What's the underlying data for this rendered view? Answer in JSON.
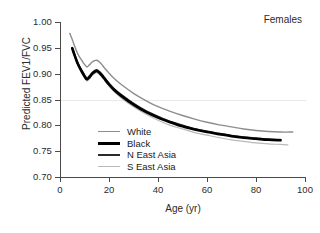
{
  "panel": {
    "title": "Females"
  },
  "axes": {
    "y": {
      "label": "Predicted FEV1/FVC",
      "ticks": [
        "1.00",
        "0.95",
        "0.90",
        "0.85",
        "0.80",
        "0.75",
        "0.70"
      ],
      "min": 0.7,
      "max": 1.0,
      "gridlines": [
        0.85
      ]
    },
    "x": {
      "label": "Age (yr)",
      "ticks": [
        "0",
        "20",
        "40",
        "60",
        "80",
        "100"
      ],
      "min": 0,
      "max": 100
    }
  },
  "legend": {
    "position": "inside-lower-left",
    "items": [
      {
        "label": "White",
        "color": "#8d8d8d",
        "width": 1.4
      },
      {
        "label": "Black",
        "color": "#000000",
        "width": 2.6
      },
      {
        "label": "N East Asia",
        "color": "#2a2a2a",
        "width": 1.9
      },
      {
        "label": "S East Asia",
        "color": "#b9b9b9",
        "width": 1.2
      }
    ]
  },
  "chart_data": {
    "type": "line",
    "title": "Females",
    "xlabel": "Age (yr)",
    "ylabel": "Predicted FEV1/FVC",
    "xlim": [
      0,
      100
    ],
    "ylim": [
      0.7,
      1.0
    ],
    "grid": "horizontal-at-0.85",
    "legend_position": "inside-lower-left",
    "series": [
      {
        "name": "White",
        "color": "#8d8d8d",
        "linewidth": 1.4,
        "x": [
          4,
          5,
          6,
          7,
          8,
          9,
          10,
          11,
          12,
          13,
          14,
          15,
          16,
          17,
          18,
          20,
          22,
          25,
          30,
          35,
          40,
          45,
          50,
          55,
          60,
          65,
          70,
          75,
          80,
          85,
          90,
          95
        ],
        "y": [
          0.978,
          0.966,
          0.953,
          0.941,
          0.932,
          0.925,
          0.918,
          0.913,
          0.917,
          0.922,
          0.925,
          0.926,
          0.923,
          0.918,
          0.912,
          0.901,
          0.891,
          0.879,
          0.862,
          0.848,
          0.836,
          0.827,
          0.819,
          0.812,
          0.806,
          0.801,
          0.797,
          0.793,
          0.79,
          0.788,
          0.787,
          0.787
        ]
      },
      {
        "name": "Black",
        "color": "#000000",
        "linewidth": 2.6,
        "x": [
          5,
          6,
          7,
          8,
          9,
          10,
          11,
          12,
          13,
          14,
          15,
          16,
          17,
          18,
          20,
          22,
          25,
          30,
          35,
          40,
          45,
          50,
          55,
          60,
          65,
          70,
          75,
          80,
          85,
          90
        ],
        "y": [
          0.949,
          0.935,
          0.922,
          0.912,
          0.903,
          0.895,
          0.889,
          0.893,
          0.899,
          0.903,
          0.905,
          0.902,
          0.897,
          0.891,
          0.879,
          0.869,
          0.857,
          0.84,
          0.826,
          0.815,
          0.806,
          0.798,
          0.792,
          0.787,
          0.783,
          0.779,
          0.776,
          0.774,
          0.772,
          0.771
        ]
      },
      {
        "name": "N East Asia",
        "color": "#2a2a2a",
        "linewidth": 1.9,
        "x": [
          5,
          6,
          7,
          8,
          9,
          10,
          11,
          12,
          13,
          14,
          15,
          16,
          17,
          18,
          20,
          22,
          25,
          30,
          35,
          40,
          45,
          50,
          55,
          60,
          65,
          70,
          75,
          80,
          85,
          90
        ],
        "y": [
          0.95,
          0.936,
          0.923,
          0.913,
          0.905,
          0.897,
          0.891,
          0.895,
          0.901,
          0.905,
          0.907,
          0.904,
          0.899,
          0.893,
          0.881,
          0.871,
          0.859,
          0.842,
          0.828,
          0.817,
          0.807,
          0.8,
          0.793,
          0.788,
          0.784,
          0.78,
          0.777,
          0.775,
          0.773,
          0.772
        ]
      },
      {
        "name": "S East Asia",
        "color": "#b9b9b9",
        "linewidth": 1.2,
        "x": [
          5,
          6,
          7,
          8,
          9,
          10,
          11,
          12,
          13,
          14,
          15,
          16,
          17,
          18,
          20,
          22,
          25,
          30,
          35,
          40,
          45,
          50,
          55,
          60,
          65,
          70,
          75,
          80,
          85,
          90,
          93
        ],
        "y": [
          0.947,
          0.933,
          0.92,
          0.909,
          0.9,
          0.892,
          0.886,
          0.89,
          0.896,
          0.9,
          0.902,
          0.899,
          0.894,
          0.888,
          0.876,
          0.866,
          0.853,
          0.836,
          0.822,
          0.81,
          0.8,
          0.793,
          0.786,
          0.781,
          0.776,
          0.772,
          0.769,
          0.766,
          0.764,
          0.763,
          0.762
        ]
      }
    ]
  }
}
